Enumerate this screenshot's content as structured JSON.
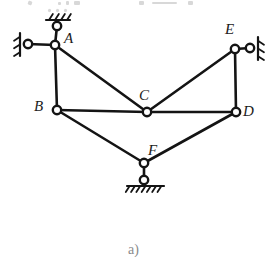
{
  "figure": {
    "caption": "a)",
    "type": "kinematic-linkage-diagram",
    "ink_color": "#141414",
    "background_color": "#ffffff",
    "label_color": "#1c1c1c",
    "caption_color": "#8a8a8a",
    "joints": [
      {
        "id": "A",
        "label": "A",
        "x": 55,
        "y": 45,
        "label_x": 64,
        "label_y": 31,
        "radius": 4.2
      },
      {
        "id": "B",
        "label": "B",
        "x": 57,
        "y": 110,
        "label_x": 34,
        "label_y": 99,
        "radius": 4.2
      },
      {
        "id": "C",
        "label": "C",
        "x": 147,
        "y": 112,
        "label_x": 139,
        "label_y": 88,
        "radius": 4.2
      },
      {
        "id": "D",
        "label": "D",
        "x": 236,
        "y": 112,
        "label_x": 243,
        "label_y": 104,
        "radius": 4.2
      },
      {
        "id": "E",
        "label": "E",
        "x": 235,
        "y": 49,
        "label_x": 225,
        "label_y": 22,
        "radius": 4.2
      },
      {
        "id": "F",
        "label": "F",
        "x": 144,
        "y": 163,
        "label_x": 148,
        "label_y": 143,
        "radius": 4.2
      }
    ],
    "links": [
      {
        "from": "A",
        "to": "B",
        "name": "link-A-B"
      },
      {
        "from": "A",
        "to": "C",
        "name": "link-A-C"
      },
      {
        "from": "B",
        "to": "C",
        "name": "link-B-C"
      },
      {
        "from": "C",
        "to": "D",
        "name": "link-C-D"
      },
      {
        "from": "C",
        "to": "E",
        "name": "link-C-E"
      },
      {
        "from": "E",
        "to": "D",
        "name": "link-E-D"
      },
      {
        "from": "B",
        "to": "F",
        "name": "link-B-F"
      },
      {
        "from": "D",
        "to": "F",
        "name": "link-D-F"
      }
    ],
    "supports": [
      {
        "name": "support-above-A",
        "attached_joint": "A",
        "pin_x": 57,
        "pin_y": 26,
        "pin_radius": 4.2,
        "orientation": "ceiling",
        "hatch_line": {
          "x1": 46,
          "y1": 20,
          "x2": 70,
          "y2": 20
        },
        "hatch_count": 4
      },
      {
        "name": "support-left-of-A",
        "attached_joint": "A",
        "pin_x": 28,
        "pin_y": 44,
        "pin_radius": 4.2,
        "orientation": "wall-left",
        "hatch_line": {
          "x1": 20,
          "y1": 33,
          "x2": 20,
          "y2": 56
        },
        "hatch_count": 3
      },
      {
        "name": "support-right-of-E",
        "attached_joint": "E",
        "pin_x": 250,
        "pin_y": 48,
        "pin_radius": 4.2,
        "orientation": "wall-right",
        "hatch_line": {
          "x1": 258,
          "y1": 37,
          "x2": 258,
          "y2": 60
        },
        "hatch_count": 3
      },
      {
        "name": "support-below-F",
        "attached_joint": "F",
        "pin_x": 144,
        "pin_y": 180,
        "pin_radius": 4.2,
        "orientation": "ground",
        "hatch_line": {
          "x1": 127,
          "y1": 186,
          "x2": 164,
          "y2": 186
        },
        "hatch_count": 7
      }
    ],
    "caption_x": 128,
    "caption_y": 243
  }
}
